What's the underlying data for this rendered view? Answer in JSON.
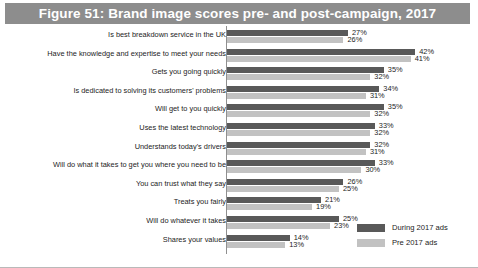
{
  "figure": {
    "title": "Figure 51: Brand image scores pre- and post-campaign, 2017"
  },
  "legend": {
    "during_label": "During 2017 ads",
    "pre_label": "Pre 2017 ads"
  },
  "colors": {
    "title_banner": "#8d8d8d",
    "during_bar": "#595959",
    "pre_bar": "#c2c2c2",
    "text": "#1c1c1c"
  },
  "chart_data": {
    "type": "bar",
    "orientation": "horizontal",
    "title": "Figure 51: Brand image scores pre- and post-campaign, 2017",
    "xlabel": "",
    "ylabel": "",
    "xlim": [
      0,
      42
    ],
    "grid": false,
    "legend_position": "bottom-right",
    "value_suffix": "%",
    "categories": [
      "Is best breakdown service in the UK",
      "Have the knowledge and expertise to meet your needs",
      "Gets you going quickly",
      "Is dedicated to solving its customers' problems",
      "Will get to you quickly",
      "Uses the latest technology",
      "Understands today's drivers",
      "Will do what it takes to get you where you need to be",
      "You can trust what they say",
      "Treats you fairly",
      "Will do whatever it takes",
      "Shares your values"
    ],
    "series": [
      {
        "name": "During 2017 ads",
        "color": "#595959",
        "values": [
          27,
          42,
          35,
          34,
          35,
          33,
          32,
          33,
          26,
          21,
          25,
          14
        ],
        "labels": [
          "27%",
          "42%",
          "35%",
          "34%",
          "35%",
          "33%",
          "32%",
          "33%",
          "26%",
          "21%",
          "25%",
          "14%"
        ]
      },
      {
        "name": "Pre 2017 ads",
        "color": "#c2c2c2",
        "values": [
          26,
          41,
          32,
          31,
          32,
          32,
          31,
          30,
          25,
          19,
          23,
          13
        ],
        "labels": [
          "26%",
          "41%",
          "32%",
          "31%",
          "32%",
          "32%",
          "31%",
          "30%",
          "25%",
          "19%",
          "23%",
          "13%"
        ]
      }
    ]
  }
}
